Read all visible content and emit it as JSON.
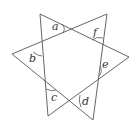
{
  "figure": {
    "type": "six-pointed star formed by intersecting lines",
    "stroke_color": "#555555",
    "label_color": "#333333",
    "background": "#ffffff",
    "vertices": {
      "top_left": [
        40,
        14
      ],
      "top_right": [
        107,
        14
      ],
      "right": [
        129,
        57
      ],
      "left": [
        12,
        54
      ],
      "bottom_left": [
        48,
        116
      ],
      "bottom_right": [
        93,
        120
      ]
    },
    "labels": [
      {
        "id": "a",
        "text": "a",
        "x": 52,
        "y": 30
      },
      {
        "id": "f",
        "text": "f",
        "x": 93,
        "y": 36
      },
      {
        "id": "b",
        "text": "b",
        "x": 29,
        "y": 62
      },
      {
        "id": "e",
        "text": "e",
        "x": 102,
        "y": 68
      },
      {
        "id": "c",
        "text": "c",
        "x": 51,
        "y": 101
      },
      {
        "id": "d",
        "text": "d",
        "x": 82,
        "y": 105
      }
    ]
  }
}
